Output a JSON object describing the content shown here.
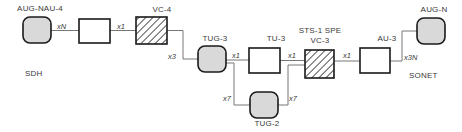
{
  "diagram": {
    "domain_labels": [
      {
        "id": "sdh",
        "text": "SDH",
        "x": 25,
        "y": 69
      },
      {
        "id": "sonet",
        "text": "SONET",
        "x": 409,
        "y": 71
      }
    ],
    "nodes": [
      {
        "id": "aug-nau-4",
        "label": "AUG-NAU-4",
        "shape": "rounded",
        "fill": "#d9d9d9",
        "x": 23,
        "y": 17,
        "w": 28,
        "h": 26,
        "label_x": 14,
        "label_y": 4
      },
      {
        "id": "au-4",
        "label": "",
        "shape": "square",
        "fill": "#ffffff",
        "x": 79,
        "y": 19,
        "w": 31,
        "h": 24,
        "label_x": 0,
        "label_y": 0
      },
      {
        "id": "vc-4",
        "label": "VC-4",
        "shape": "hatched",
        "fill": "#ffffff",
        "x": 136,
        "y": 17,
        "w": 31,
        "h": 27,
        "label_x": 136,
        "label_y": 5
      },
      {
        "id": "tug-3",
        "label": "TUG-3",
        "shape": "rounded",
        "fill": "#d9d9d9",
        "x": 198,
        "y": 46,
        "w": 28,
        "h": 26,
        "label_x": 189,
        "label_y": 34
      },
      {
        "id": "tu-3",
        "label": "TU-3",
        "shape": "square",
        "fill": "#ffffff",
        "x": 249,
        "y": 48,
        "w": 31,
        "h": 25,
        "label_x": 250,
        "label_y": 34
      },
      {
        "id": "vc-3",
        "label": "STS-1 SPE\nVC-3",
        "shape": "hatched",
        "fill": "#ffffff",
        "x": 305,
        "y": 50,
        "w": 29,
        "h": 28,
        "label_x": 294,
        "label_y": 26
      },
      {
        "id": "au-3",
        "label": "AU-3",
        "shape": "square",
        "fill": "#ffffff",
        "x": 360,
        "y": 48,
        "w": 30,
        "h": 25,
        "label_x": 361,
        "label_y": 34
      },
      {
        "id": "aug-n",
        "label": "AUG-N",
        "shape": "rounded",
        "fill": "#d9d9d9",
        "x": 417,
        "y": 18,
        "w": 28,
        "h": 26,
        "label_x": 408,
        "label_y": 5
      },
      {
        "id": "tug-2",
        "label": "TUG-2",
        "shape": "rounded",
        "fill": "#d9d9d9",
        "x": 250,
        "y": 92,
        "w": 28,
        "h": 26,
        "label_x": 241,
        "label_y": 119
      }
    ],
    "edges": [
      {
        "id": "e-aug-nau4-au4",
        "from": "aug-nau-4",
        "to": "au-4",
        "label": "xN",
        "label_x": 57,
        "label_y": 22,
        "path": "M51,30.5 L79,30.5"
      },
      {
        "id": "e-au4-vc4",
        "from": "au-4",
        "to": "vc-4",
        "label": "x1",
        "label_x": 117,
        "label_y": 22,
        "path": "M110,30.5 L136,30.5"
      },
      {
        "id": "e-vc4-tug3",
        "from": "vc-4",
        "to": "tug-3",
        "label": "x3",
        "label_x": 168,
        "label_y": 52,
        "path": "M167,30.5 L183,30.5 L183,59 L198,59"
      },
      {
        "id": "e-tug3-tu3",
        "from": "tug-3",
        "to": "tu-3",
        "label": "x1",
        "label_x": 232,
        "label_y": 51,
        "path": "M226,60 L249,60"
      },
      {
        "id": "e-tu3-vc3",
        "from": "tu-3",
        "to": "vc-3",
        "label": "x1",
        "label_x": 288,
        "label_y": 51,
        "path": "M280,60.5 L305,60.5"
      },
      {
        "id": "e-vc3-au3",
        "from": "vc-3",
        "to": "au-3",
        "label": "x1",
        "label_x": 343,
        "label_y": 51,
        "path": "M334,61 L360,61"
      },
      {
        "id": "e-au3-augn",
        "from": "au-3",
        "to": "aug-n",
        "label": "x3N",
        "label_x": 404,
        "label_y": 53,
        "path": "M390,61 L402,61 L402,31 L417,31"
      },
      {
        "id": "e-tug3-tug2",
        "from": "tug-3",
        "to": "tug-2",
        "label": "x7",
        "label_x": 223,
        "label_y": 94,
        "path": "M226,63 L234,63 L234,105 L250,105"
      },
      {
        "id": "e-tug2-vc3",
        "from": "tug-2",
        "to": "vc-3",
        "label": "x7",
        "label_x": 289,
        "label_y": 94,
        "path": "M278,105 L288,105 L288,65 L305,65"
      }
    ],
    "style": {
      "line_color": "#777777",
      "stroke_color": "#1a1a1a",
      "node_fill_gray": "#d9d9d9",
      "node_fill_white": "#ffffff",
      "hatch_color": "#555555",
      "text_color": "#3a3a3a"
    }
  }
}
